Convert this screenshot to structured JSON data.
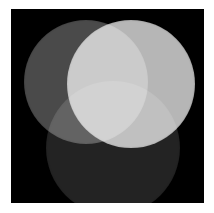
{
  "figure": {
    "page_background": "#ffffff",
    "panel_background": "#000000",
    "blend_mode": "screen",
    "panel": {
      "x": 11,
      "y": 9,
      "width": 193,
      "height": 194
    }
  },
  "chart_data": {
    "type": "venn",
    "xlabel": "",
    "ylabel": "",
    "grid": false,
    "legend": "none",
    "background": "#000000",
    "blend": "screen",
    "sets": [
      {
        "name": "left",
        "label": "Left disc",
        "color": "#4a4a4a",
        "cx": 75,
        "cy": 73,
        "r": 62,
        "brightness": 0.29
      },
      {
        "name": "right",
        "label": "Right disc",
        "color": "#b6b6b6",
        "cx": 120,
        "cy": 75,
        "r": 64,
        "brightness": 0.71
      },
      {
        "name": "bottom",
        "label": "Bottom disc",
        "color": "#232323",
        "cx": 102,
        "cy": 139,
        "r": 67,
        "brightness": 0.14
      }
    ],
    "regions": [
      {
        "name": "left-only",
        "members": [
          "left"
        ],
        "color": "#4a4a4a"
      },
      {
        "name": "right-only",
        "members": [
          "right"
        ],
        "color": "#b6b6b6"
      },
      {
        "name": "bottom-only",
        "members": [
          "bottom"
        ],
        "color": "#232323"
      },
      {
        "name": "left-right",
        "members": [
          "left",
          "right"
        ],
        "color": "#e2e2e2"
      },
      {
        "name": "left-bottom",
        "members": [
          "left",
          "bottom"
        ],
        "color": "#5f5f5f"
      },
      {
        "name": "right-bottom",
        "members": [
          "right",
          "bottom"
        ],
        "color": "#c2c2c2"
      },
      {
        "name": "left-right-bottom",
        "members": [
          "left",
          "right",
          "bottom"
        ],
        "color": "#ffffff"
      }
    ]
  }
}
